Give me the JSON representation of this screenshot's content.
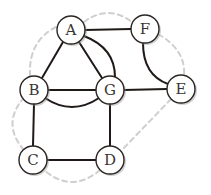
{
  "diagram": {
    "type": "graph",
    "node_radius": 14,
    "nodes": [
      {
        "id": "A",
        "label": "A",
        "x": 71,
        "y": 30
      },
      {
        "id": "F",
        "label": "F",
        "x": 145,
        "y": 29
      },
      {
        "id": "B",
        "label": "B",
        "x": 34,
        "y": 90
      },
      {
        "id": "G",
        "label": "G",
        "x": 110,
        "y": 90
      },
      {
        "id": "E",
        "label": "E",
        "x": 181,
        "y": 89
      },
      {
        "id": "C",
        "label": "C",
        "x": 33,
        "y": 160
      },
      {
        "id": "D",
        "label": "D",
        "x": 110,
        "y": 160
      }
    ],
    "edges": [
      {
        "from": "A",
        "to": "F",
        "style": "solid",
        "shape": "straight"
      },
      {
        "from": "A",
        "to": "B",
        "style": "solid",
        "shape": "straight"
      },
      {
        "from": "A",
        "to": "G",
        "style": "solid",
        "shape": "straight"
      },
      {
        "from": "A",
        "to": "G",
        "style": "solid",
        "shape": "curved"
      },
      {
        "from": "B",
        "to": "G",
        "style": "solid",
        "shape": "straight"
      },
      {
        "from": "B",
        "to": "G",
        "style": "solid",
        "shape": "curved"
      },
      {
        "from": "G",
        "to": "E",
        "style": "solid",
        "shape": "straight"
      },
      {
        "from": "F",
        "to": "E",
        "style": "solid",
        "shape": "curved"
      },
      {
        "from": "B",
        "to": "C",
        "style": "solid",
        "shape": "straight"
      },
      {
        "from": "G",
        "to": "D",
        "style": "solid",
        "shape": "straight"
      },
      {
        "from": "C",
        "to": "D",
        "style": "solid",
        "shape": "straight"
      }
    ],
    "dashed_cycle": {
      "style": "dashed",
      "color": "#cfcfcf",
      "order": [
        "A",
        "F",
        "E",
        "D",
        "C",
        "B",
        "A"
      ]
    },
    "colors": {
      "edge": "#1f1a17",
      "node_fill": "#ffffff",
      "node_stroke": "#2a2522",
      "label": "#3a3532",
      "background": "#ffffff"
    }
  }
}
